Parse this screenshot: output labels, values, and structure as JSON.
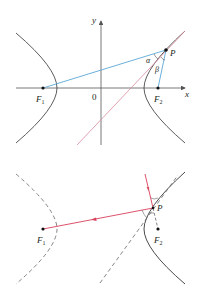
{
  "colors": {
    "curve": "#4a4a4a",
    "axis": "#555555",
    "focal_lines": "#5aa7d6",
    "tangent_top": "#d98a9a",
    "ray": "#d9405a",
    "point": "#111111"
  },
  "top_diagram": {
    "axis_labels": {
      "x": "x",
      "y": "y",
      "origin": "0"
    },
    "points": {
      "F1": {
        "label": "F",
        "sub": "1"
      },
      "F2": {
        "label": "F",
        "sub": "2"
      },
      "P": {
        "label": "P"
      }
    },
    "angles": {
      "alpha": "α",
      "beta": "β"
    }
  },
  "bottom_diagram": {
    "points": {
      "F1": {
        "label": "F",
        "sub": "1"
      },
      "F2": {
        "label": "F",
        "sub": "2"
      },
      "P": {
        "label": "P"
      }
    }
  }
}
